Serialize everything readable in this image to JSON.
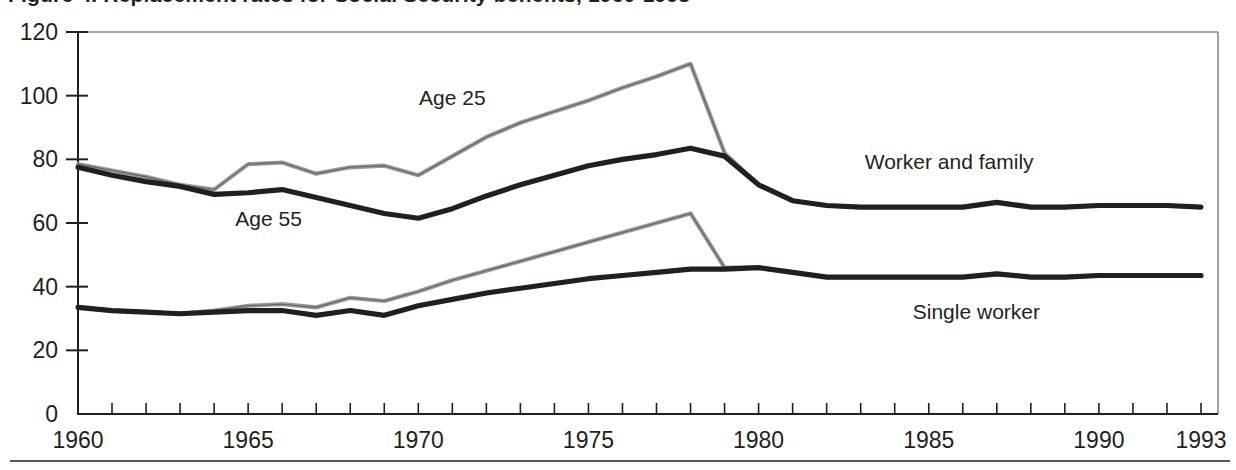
{
  "figure": {
    "title": "Figure 4. Replacement rates for Social Security benefits, 1960-1993",
    "title_clipped": true
  },
  "chart_data": {
    "type": "line",
    "title": "Figure 4. Replacement rates for Social Security benefits, 1960-1993",
    "xlabel": "",
    "ylabel": "",
    "xlim": [
      1960,
      1993.5
    ],
    "ylim": [
      0,
      120
    ],
    "grid": false,
    "legend_position": "inline-annotations",
    "y_ticks": [
      0,
      20,
      40,
      60,
      80,
      100,
      120
    ],
    "x_ticks_major": [
      1960,
      1965,
      1970,
      1975,
      1980,
      1985,
      1990,
      1993
    ],
    "x_tick_minor_step": 1,
    "annotations": [
      {
        "text": "Age 25",
        "x": 1971.0,
        "y": 97,
        "name": "age-25-label"
      },
      {
        "text": "Age 55",
        "x": 1965.6,
        "y": 59,
        "name": "age-55-label"
      },
      {
        "text": "Worker and family",
        "x": 1985.6,
        "y": 77,
        "name": "worker-and-family-label"
      },
      {
        "text": "Single worker",
        "x": 1986.4,
        "y": 30,
        "name": "single-worker-label"
      }
    ],
    "x": [
      1960,
      1961,
      1962,
      1963,
      1964,
      1965,
      1966,
      1967,
      1968,
      1969,
      1970,
      1971,
      1972,
      1973,
      1974,
      1975,
      1976,
      1977,
      1978,
      1979,
      1980,
      1981,
      1982,
      1983,
      1984,
      1985,
      1986,
      1987,
      1988,
      1989,
      1990,
      1991,
      1992,
      1993
    ],
    "series": [
      {
        "name": "Worker and family, Age 25",
        "style": "light",
        "values": [
          78.5,
          76.5,
          74.5,
          72.0,
          70.5,
          78.5,
          79.0,
          75.5,
          77.5,
          78.0,
          75.0,
          81.0,
          87.0,
          91.5,
          95.0,
          98.5,
          102.5,
          106.0,
          110.0,
          82.0,
          72.0,
          67.0,
          65.5,
          65.0,
          65.0,
          65.0,
          65.0,
          66.5,
          65.0,
          65.0,
          65.5,
          65.5,
          65.5,
          65.0
        ]
      },
      {
        "name": "Worker and family, Age 55",
        "style": "dark",
        "values": [
          77.5,
          75.0,
          73.0,
          71.5,
          69.0,
          69.5,
          70.5,
          68.0,
          65.5,
          63.0,
          61.5,
          64.5,
          68.5,
          72.0,
          75.0,
          78.0,
          80.0,
          81.5,
          83.5,
          81.0,
          72.0,
          67.0,
          65.5,
          65.0,
          65.0,
          65.0,
          65.0,
          66.5,
          65.0,
          65.0,
          65.5,
          65.5,
          65.5,
          65.0
        ]
      },
      {
        "name": "Single worker, Age 25",
        "style": "light",
        "values": [
          33.5,
          32.5,
          32.0,
          31.5,
          32.5,
          34.0,
          34.5,
          33.5,
          36.5,
          35.5,
          38.5,
          42.0,
          45.0,
          48.0,
          51.0,
          54.0,
          57.0,
          60.0,
          63.0,
          46.0,
          46.0,
          44.5,
          43.0,
          43.0,
          43.0,
          43.0,
          43.0,
          44.0,
          43.0,
          43.0,
          43.5,
          43.5,
          43.5,
          43.5
        ]
      },
      {
        "name": "Single worker, Age 55",
        "style": "dark",
        "values": [
          33.5,
          32.5,
          32.0,
          31.5,
          32.0,
          32.5,
          32.5,
          31.0,
          32.5,
          31.0,
          34.0,
          36.0,
          38.0,
          39.5,
          41.0,
          42.5,
          43.5,
          44.5,
          45.5,
          45.5,
          46.0,
          44.5,
          43.0,
          43.0,
          43.0,
          43.0,
          43.0,
          44.0,
          43.0,
          43.0,
          43.5,
          43.5,
          43.5,
          43.5
        ]
      }
    ]
  }
}
